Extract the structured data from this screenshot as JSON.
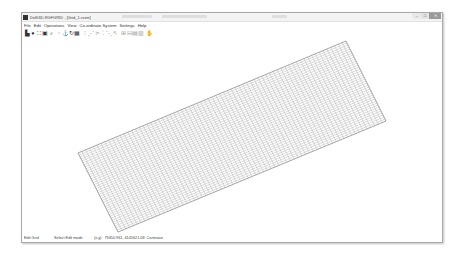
{
  "window": {
    "title": "Delft3D-RGFGRID - [Grid_1.rvsm]",
    "controls": {
      "minimize": "–",
      "maximize": "□",
      "close": "✕"
    }
  },
  "menubar": {
    "items": [
      "File",
      "Edit",
      "Operations",
      "View",
      "Co-ordinate System",
      "Settings",
      "Help"
    ]
  },
  "toolbar": {
    "tools": [
      {
        "icon": "print-icon",
        "glyph": "▙",
        "enabled": true
      },
      {
        "icon": "globe-icon",
        "glyph": "●",
        "enabled": true
      },
      {
        "icon": "zoom-extent-icon",
        "glyph": "⛶",
        "enabled": true
      },
      {
        "icon": "zoom-box-icon",
        "glyph": "▣",
        "enabled": true
      },
      {
        "icon": "zoom-in-icon",
        "glyph": "⌕",
        "enabled": true
      },
      {
        "icon": "blank-icon",
        "glyph": "▫",
        "enabled": false
      },
      {
        "icon": "anchor-icon",
        "glyph": "⚓",
        "enabled": true
      },
      {
        "icon": "refresh-icon",
        "glyph": "↻",
        "enabled": true
      },
      {
        "icon": "grid-icon",
        "glyph": "▦",
        "enabled": true
      },
      {
        "icon": "select-icon",
        "glyph": "⁝",
        "enabled": false
      },
      {
        "icon": "spline-icon",
        "glyph": "⋰",
        "enabled": false
      },
      {
        "icon": "polygon-icon",
        "glyph": "⋗",
        "enabled": false
      },
      {
        "icon": "point-icon",
        "glyph": "⁚",
        "enabled": false
      },
      {
        "icon": "line-icon",
        "glyph": "⋱",
        "enabled": false
      },
      {
        "icon": "arrow-icon",
        "glyph": "↖",
        "enabled": false
      },
      {
        "icon": "grid-cells-icon",
        "glyph": "⊞",
        "enabled": false
      },
      {
        "icon": "grid-split-icon",
        "glyph": "⊟",
        "enabled": false
      },
      {
        "icon": "grid-refine-icon",
        "glyph": "▤",
        "enabled": false
      },
      {
        "icon": "grid-table-icon",
        "glyph": "▥",
        "enabled": false
      },
      {
        "icon": "pan-hand-icon",
        "glyph": "✋",
        "enabled": true
      }
    ]
  },
  "grid": {
    "corners": [
      [
        77,
        152
      ],
      [
        345,
        40
      ],
      [
        385,
        120
      ],
      [
        117,
        231
      ]
    ],
    "lines_u": 70,
    "lines_v": 40,
    "line_color": "#9a9a9a"
  },
  "statusbar": {
    "mode": "Edit Grid",
    "hint": "Select Edit mode",
    "coords_label": "(x,y):",
    "coords": "79450.961, 4105621.08",
    "system": "Cartesian"
  }
}
